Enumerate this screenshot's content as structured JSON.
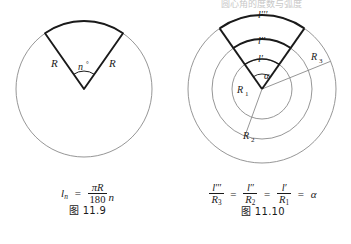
{
  "page": {
    "background": "#ffffff",
    "ink": "#1a1a1a",
    "thin_stroke": "#8a8a8a",
    "scan_header_faint": "圆心角的度数与弧度"
  },
  "figures": [
    {
      "id": "fig-11-9",
      "caption": "图 11.9",
      "description": "circle with a highlighted sector whose apex is the centre",
      "geometry": {
        "center": [
          84,
          89
        ],
        "radius": 68,
        "sector_start_deg": 55,
        "sector_end_deg": 125,
        "angle_arc_radius": 18
      },
      "labels": {
        "radius_left": "R",
        "radius_right": "R",
        "central_angle": "n",
        "degree_sign": "°"
      },
      "formula": {
        "lhs_symbol": "l",
        "lhs_subscript": "n",
        "equals": "=",
        "numerator": "πR",
        "denominator": "180",
        "trailing_factor": "n"
      }
    },
    {
      "id": "fig-11-10",
      "caption": "图 11.10",
      "description": "three concentric circles sharing one central angle, arcs highlighted",
      "geometry": {
        "center": [
          87,
          89
        ],
        "radii": [
          30,
          50,
          74
        ],
        "sector_start_deg": 55,
        "sector_end_deg": 125,
        "angle_arc_radius": 15,
        "radius_lines_deg": [
          22,
          250
        ]
      },
      "labels": {
        "arc_outer": "l‴",
        "arc_middle": "l″",
        "arc_inner": "l′",
        "radius_1": "R",
        "radius_1_sub": "1",
        "radius_2": "R",
        "radius_2_sub": "2",
        "radius_3": "R",
        "radius_3_sub": "3",
        "central_angle": "α"
      },
      "formula": {
        "terms": [
          {
            "numerator": "l‴",
            "denominator": "R",
            "denominator_sub": "3"
          },
          {
            "numerator": "l″",
            "denominator": "R",
            "denominator_sub": "2"
          },
          {
            "numerator": "l′",
            "denominator": "R",
            "denominator_sub": "1"
          }
        ],
        "equals": "=",
        "result": "α"
      }
    }
  ]
}
